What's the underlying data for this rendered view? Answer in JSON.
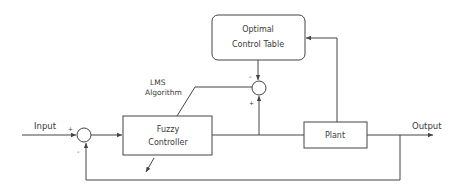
{
  "diagram": {
    "type": "control-system block diagram",
    "blocks": {
      "optimal_control_table": {
        "line1": "Optimal",
        "line2": "Control Table"
      },
      "fuzzy_controller": {
        "line1": "Fuzzy",
        "line2": "Controller"
      },
      "plant": {
        "label": "Plant"
      }
    },
    "labels": {
      "input": "Input",
      "output": "Output",
      "lms_line1": "LMS",
      "lms_line2": "Algorithm"
    },
    "signs": {
      "sum1_plus": "+",
      "sum1_minus": "-",
      "sum2_minus": "-",
      "sum2_plus": "+"
    },
    "colors": {
      "stroke": "#444444",
      "text": "#3a3a3a",
      "background": "#ffffff"
    }
  }
}
